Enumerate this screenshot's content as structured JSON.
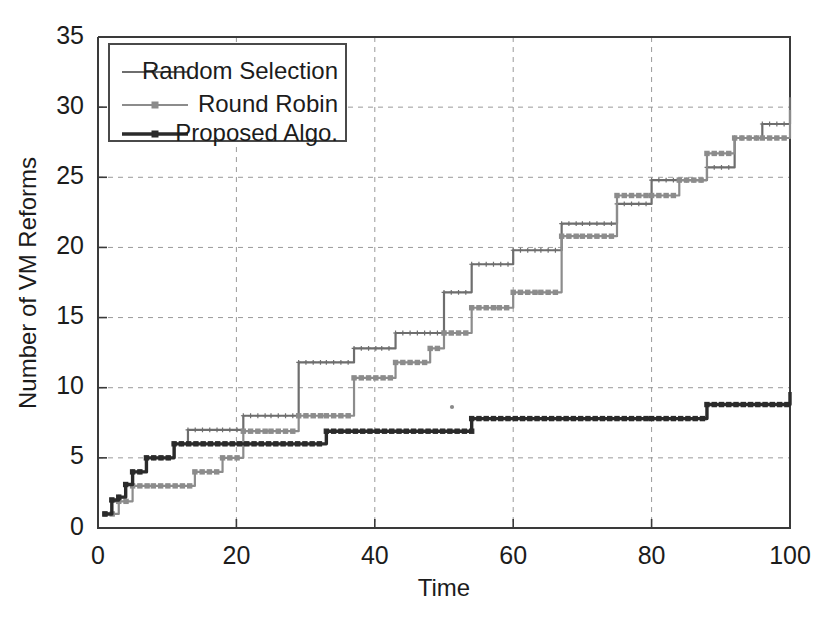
{
  "chart_data": {
    "type": "line",
    "title": "",
    "xlabel": "Time",
    "ylabel": "Number of VM Reforms",
    "xlim": [
      0,
      100
    ],
    "ylim": [
      0,
      35
    ],
    "xticks": [
      0,
      20,
      40,
      60,
      80,
      100
    ],
    "yticks": [
      0,
      5,
      10,
      15,
      20,
      25,
      30,
      35
    ],
    "xtick_labels": [
      "0",
      "20",
      "40",
      "60",
      "80",
      "100"
    ],
    "ytick_labels": [
      "0",
      "5",
      "10",
      "15",
      "20",
      "25",
      "30",
      "35"
    ],
    "grid": true,
    "grid_style": "dashed",
    "legend_position": "upper-left",
    "step_style": "post",
    "series": [
      {
        "name": "Random Selection",
        "color": "#6e6e6e",
        "marker": "cross",
        "line_width": 2.2,
        "x": [
          1,
          2,
          3,
          4,
          5,
          7,
          11,
          13,
          18,
          21,
          25,
          29,
          33,
          37,
          41,
          43,
          48,
          50,
          54,
          60,
          64,
          67,
          70,
          75,
          80,
          84,
          88,
          92,
          96,
          100
        ],
        "y": [
          1,
          1.9,
          2.2,
          3.1,
          4,
          5,
          6,
          7,
          7,
          8,
          8,
          11.8,
          11.8,
          12.8,
          12.8,
          13.9,
          13.9,
          16.8,
          18.8,
          19.8,
          19.8,
          21.7,
          21.7,
          23.1,
          24.8,
          24.8,
          25.7,
          27.8,
          28.8,
          30.7
        ]
      },
      {
        "name": "Round Robin",
        "color": "#8c8c8c",
        "marker": "square",
        "line_width": 2.2,
        "x": [
          1,
          3,
          5,
          8,
          14,
          18,
          21,
          25,
          29,
          33,
          37,
          43,
          48,
          50,
          54,
          58,
          60,
          64,
          67,
          70,
          75,
          80,
          84,
          88,
          92,
          96,
          100
        ],
        "y": [
          1,
          1.9,
          3,
          3,
          4,
          5,
          6.9,
          6.9,
          8,
          8,
          10.7,
          11.8,
          12.8,
          13.9,
          15.7,
          15.7,
          16.8,
          16.8,
          20.8,
          20.8,
          23.7,
          23.7,
          24.8,
          26.7,
          27.8,
          27.8,
          29.8
        ]
      },
      {
        "name": "Proposed Algo.",
        "color": "#2b2b2b",
        "marker": "square",
        "line_width": 3.4,
        "x": [
          1,
          2,
          3,
          4,
          5,
          7,
          11,
          33,
          54,
          80,
          88,
          100
        ],
        "y": [
          1,
          2,
          2.2,
          3.1,
          4,
          5,
          6,
          6.9,
          7.8,
          7.8,
          8.8,
          9.7
        ]
      }
    ]
  },
  "legend": {
    "items": [
      {
        "label": "Random Selection"
      },
      {
        "label": "Round Robin"
      },
      {
        "label": "Proposed Algo."
      }
    ]
  }
}
